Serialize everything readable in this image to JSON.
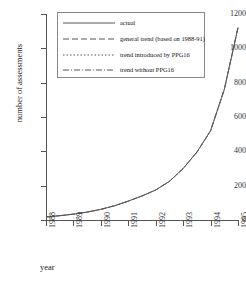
{
  "chart_data": {
    "type": "line",
    "title": "",
    "xlabel": "year",
    "ylabel": "number of assessments",
    "xlim": [
      1988,
      1995
    ],
    "ylim": [
      0,
      1200
    ],
    "grid": false,
    "legend_position": "top-center",
    "ytick_labels": [
      "0",
      "200",
      "400",
      "600",
      "800",
      "1000",
      "1200"
    ],
    "ytick_values": [
      0,
      200,
      400,
      600,
      800,
      1000,
      1200
    ],
    "xtick_labels": [
      "1988",
      "1989",
      "1990",
      "1991",
      "1992",
      "1993",
      "1994",
      "1995"
    ],
    "xtick_values": [
      1988,
      1989,
      1990,
      1991,
      1992,
      1993,
      1994,
      1995
    ],
    "x": [
      1988,
      1988.5,
      1989,
      1989.5,
      1990,
      1990.5,
      1991,
      1991.5,
      1992,
      1992.5,
      1993,
      1993.5,
      1994,
      1994.5,
      1995
    ],
    "series": [
      {
        "name": "actual",
        "style": "solid",
        "color": "#555555",
        "values": [
          18,
          25,
          34,
          46,
          62,
          83,
          110,
          140,
          175,
          225,
          300,
          395,
          520,
          760,
          1120
        ]
      },
      {
        "name": "general trend (based on 1988-91)",
        "style": "dashed",
        "color": "#555555",
        "values": [
          18,
          25,
          34,
          46,
          62,
          83,
          110,
          140,
          175,
          225,
          300,
          395,
          520,
          760,
          1120
        ]
      },
      {
        "name": "trend introduced by PPG16",
        "style": "dotted",
        "color": "#555555",
        "values": [
          18,
          25,
          34,
          46,
          62,
          83,
          110,
          140,
          175,
          225,
          300,
          395,
          520,
          760,
          1120
        ]
      },
      {
        "name": "trend without PPG16",
        "style": "dashdot",
        "color": "#555555",
        "values": [
          18,
          25,
          34,
          46,
          62,
          83,
          110,
          140,
          175,
          225,
          300,
          395,
          520,
          760,
          1120
        ]
      }
    ]
  },
  "legend": {
    "items": [
      {
        "label": "actual"
      },
      {
        "label": "general trend (based on 1988-91)"
      },
      {
        "label": "trend introduced by PPG16"
      },
      {
        "label": "trend without PPG16"
      }
    ]
  }
}
